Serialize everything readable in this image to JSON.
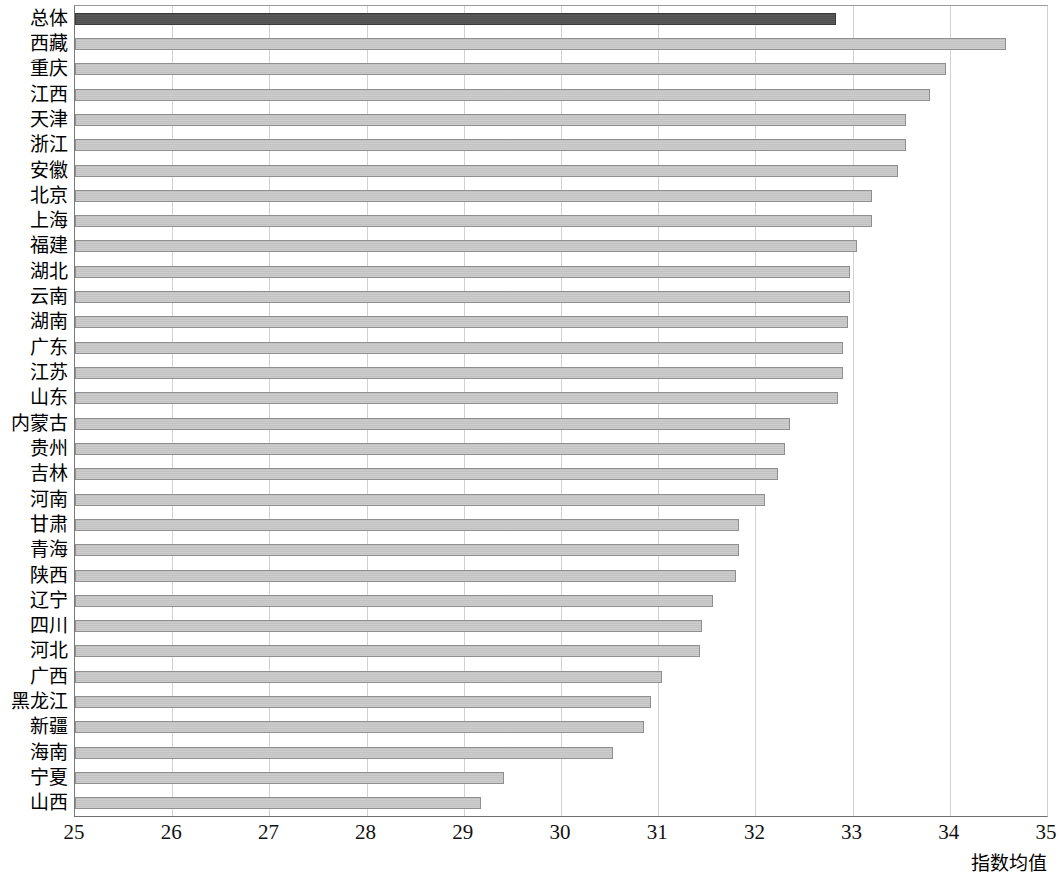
{
  "chart_data": {
    "type": "bar",
    "orientation": "horizontal",
    "title": "",
    "subtitle": "",
    "xlabel": "指数均值",
    "ylabel": "",
    "xlim": [
      25,
      35
    ],
    "xticks": [
      25,
      26,
      27,
      28,
      29,
      30,
      31,
      32,
      33,
      34,
      35
    ],
    "xtick_labels": [
      "25",
      "26",
      "27",
      "28",
      "29",
      "30",
      "31",
      "32",
      "33",
      "34",
      "35"
    ],
    "grid": true,
    "grid_axis": "x",
    "legend": null,
    "legend_position": "none",
    "categories": [
      "总体",
      "西藏",
      "重庆",
      "江西",
      "天津",
      "浙江",
      "安徽",
      "北京",
      "上海",
      "福建",
      "湖北",
      "云南",
      "湖南",
      "广东",
      "江苏",
      "山东",
      "内蒙古",
      "贵州",
      "吉林",
      "河南",
      "甘肃",
      "青海",
      "陕西",
      "辽宁",
      "四川",
      "河北",
      "广西",
      "黑龙江",
      "新疆",
      "海南",
      "宁夏",
      "山西"
    ],
    "values": [
      32.83,
      34.58,
      33.96,
      33.8,
      33.55,
      33.55,
      33.47,
      33.2,
      33.2,
      33.05,
      32.97,
      32.97,
      32.95,
      32.9,
      32.9,
      32.85,
      32.36,
      32.3,
      32.23,
      32.1,
      31.83,
      31.83,
      31.8,
      31.56,
      31.45,
      31.43,
      31.04,
      30.93,
      30.85,
      30.53,
      29.41,
      29.18
    ],
    "highlight_index": 0,
    "colors": {
      "bar": "#bcbcbc",
      "bar_edge": "#8f8f8f",
      "highlight_bar": "#4c4c4c",
      "highlight_edge": "#3a3a3a",
      "grid": "#d2d2d2",
      "axis": "#6f6f6f",
      "text": "#000000"
    }
  }
}
